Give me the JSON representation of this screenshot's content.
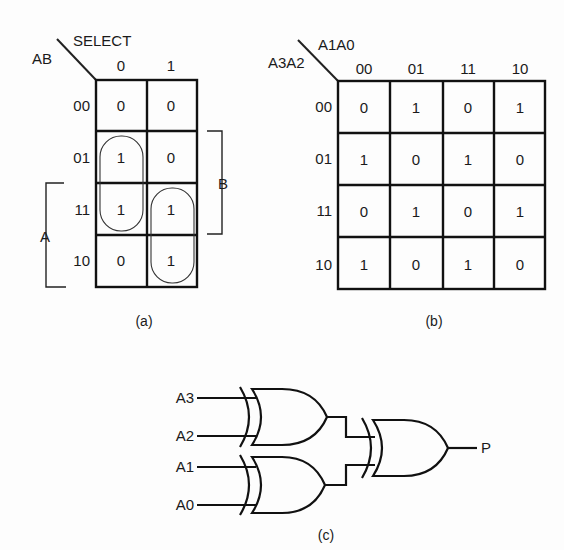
{
  "figure_a": {
    "caption": "(a)",
    "corner_label_cols": "SELECT",
    "corner_label_rows": "AB",
    "col_headers": [
      "0",
      "1"
    ],
    "row_headers": [
      "00",
      "01",
      "11",
      "10"
    ],
    "cells": [
      [
        "0",
        "0"
      ],
      [
        "1",
        "0"
      ],
      [
        "1",
        "1"
      ],
      [
        "0",
        "1"
      ]
    ],
    "groups": [
      {
        "name": "loop-select0",
        "cells": "rows 01-11, col 0"
      },
      {
        "name": "loop-select1",
        "cells": "rows 11-10, col 1"
      }
    ],
    "bracket_b_label": "B",
    "bracket_a_label": "A"
  },
  "figure_b": {
    "caption": "(b)",
    "corner_label_cols": "A1A0",
    "corner_label_rows": "A3A2",
    "col_headers": [
      "00",
      "01",
      "11",
      "10"
    ],
    "row_headers": [
      "00",
      "01",
      "11",
      "10"
    ],
    "cells": [
      [
        "0",
        "1",
        "0",
        "1"
      ],
      [
        "1",
        "0",
        "1",
        "0"
      ],
      [
        "0",
        "1",
        "0",
        "1"
      ],
      [
        "1",
        "0",
        "1",
        "0"
      ]
    ]
  },
  "figure_c": {
    "caption": "(c)",
    "inputs": [
      "A3",
      "A2",
      "A1",
      "A0"
    ],
    "gates": [
      "XOR",
      "XOR",
      "XOR"
    ],
    "output": "P"
  },
  "colors": {
    "ink": "#111111",
    "paper": "#fdfdfd"
  }
}
